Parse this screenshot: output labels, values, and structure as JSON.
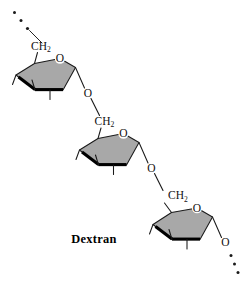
{
  "figure": {
    "caption": "Dextran",
    "background_color": "#ffffff",
    "width": 246,
    "height": 281
  },
  "chemistry": {
    "molecule_name": "Dextran",
    "repeat_unit": "alpha-D-glucopyranose",
    "linkage": "alpha(1->6) glycosidic",
    "ring_count": 3,
    "ring_fill_color": "#a8a8a8",
    "ring_stroke_color": "#1a1a1a",
    "front_edge_color": "#000000",
    "label_color": "#111111"
  },
  "atoms": {
    "ch2_text": "CH",
    "ch2_subscript": "2",
    "ring_oxygen": "O",
    "glycosidic_oxygen": "O",
    "terminal_oxygen": "O"
  },
  "units": [
    {
      "id": "unit-1",
      "ch2_label": "CH",
      "ch2_subscript": "2",
      "ring_oxygen_label": "O",
      "glycosidic_oxygen_label": "O",
      "position": "top-left"
    },
    {
      "id": "unit-2",
      "ch2_label": "CH",
      "ch2_subscript": "2",
      "ring_oxygen_label": "O",
      "glycosidic_oxygen_label": "O",
      "position": "middle"
    },
    {
      "id": "unit-3",
      "ch2_label": "CH",
      "ch2_subscript": "2",
      "ring_oxygen_label": "O",
      "glycosidic_oxygen_label": "O",
      "position": "bottom-right"
    }
  ],
  "continuation": {
    "start_dots": 3,
    "end_dots": 3,
    "dot_color": "#1a1a1a",
    "meaning": "polymer chain continues"
  }
}
